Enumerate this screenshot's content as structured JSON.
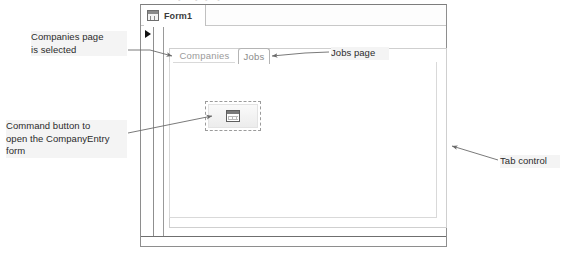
{
  "figure": {
    "top_cut_caption": "• ·   ···• ··•·· ·•· ···· ··· ·· ····  ····"
  },
  "access_window": {
    "document_tab": {
      "icon": "form-design-icon",
      "label": "Form1"
    },
    "record_selector_icon": "record-selector-arrow-icon"
  },
  "tab_control": {
    "pages": [
      {
        "label": "Companies",
        "selected": true
      },
      {
        "label": "Jobs",
        "selected": false
      }
    ],
    "command_button": {
      "icon": "open-form-icon",
      "caption": "",
      "selected": true
    }
  },
  "callouts": [
    {
      "name": "companies-page-callout",
      "text": "Companies page\nis selected"
    },
    {
      "name": "command-button-callout",
      "text": "Command button to\nopen the CompanyEntry\nform"
    },
    {
      "name": "jobs-page-callout",
      "text": "Jobs page"
    },
    {
      "name": "tab-control-callout",
      "text": "Tab control"
    }
  ],
  "colors": {
    "window_border": "#8e8e8e",
    "callout_bg": "#f4f4f4",
    "leader_line": "#6b6b6b",
    "tab_text": "#8b8b8b"
  }
}
